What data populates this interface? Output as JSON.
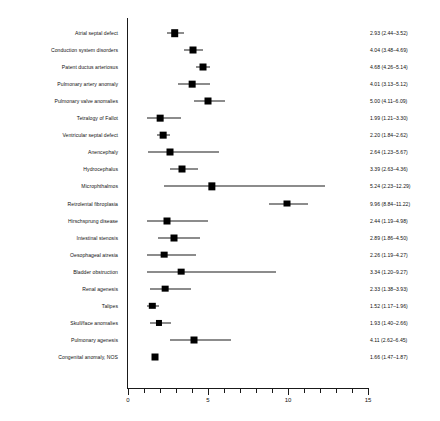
{
  "chart_data": {
    "type": "scatter",
    "subtype": "forest-plot",
    "title": "",
    "xlabel": "",
    "ylabel": "",
    "xlim": [
      0,
      15
    ],
    "grid": false,
    "legend": null,
    "axis": {
      "major_ticks": [
        0,
        5,
        10,
        15
      ],
      "major_tick_labels": [
        "0",
        "5",
        "10",
        "15"
      ],
      "minor_tick_step": 1,
      "tick_values": [
        0,
        1,
        2,
        3,
        4,
        5,
        6,
        7,
        8,
        9,
        10,
        11,
        12,
        13,
        14,
        15
      ]
    },
    "categories": [
      "Atrial septal defect",
      "Conduction system disorders",
      "Patent ductus arteriosus",
      "Pulmonary artery anomaly",
      "Pulmonary valve anomalies",
      "Tetralogy of Fallot",
      "Ventricular septal defect",
      "Anencephaly",
      "Hydrocephalus",
      "Microphthalmos",
      "Retrolental fibroplasia",
      "Hirschsprung disease",
      "Intestinal stenosis",
      "Oesophageal atresia",
      "Bladder obstruction",
      "Renal agenesis",
      "Talipes",
      "Skull/face anomalies",
      "Pulmonary agenesis",
      "Congenital anomaly, NOS"
    ],
    "estimates": [
      2.93,
      4.04,
      4.68,
      4.01,
      5.0,
      1.99,
      2.2,
      2.64,
      3.39,
      5.24,
      9.96,
      2.44,
      2.89,
      2.26,
      3.34,
      2.33,
      1.52,
      1.93,
      4.11,
      1.66
    ],
    "ci_lower": [
      2.44,
      3.48,
      4.26,
      3.13,
      4.11,
      1.21,
      1.84,
      1.23,
      2.63,
      2.23,
      8.84,
      1.19,
      1.86,
      1.19,
      1.2,
      1.38,
      1.17,
      1.4,
      2.62,
      1.47
    ],
    "ci_upper": [
      3.52,
      4.69,
      5.14,
      5.12,
      6.09,
      3.3,
      2.62,
      5.67,
      4.36,
      12.29,
      11.22,
      4.98,
      4.5,
      4.27,
      9.27,
      3.93,
      1.96,
      2.66,
      6.45,
      1.87
    ],
    "marker_weights": [
      1.0,
      0.92,
      0.92,
      0.88,
      0.92,
      0.88,
      0.88,
      0.92,
      0.92,
      0.96,
      0.92,
      0.92,
      0.92,
      0.88,
      0.88,
      0.88,
      0.84,
      0.8,
      0.92,
      0.92
    ],
    "value_labels": [
      "2.93 (2.44–3.52)",
      "4.04 (3.48–4.69)",
      "4.68 (4.26–5.14)",
      "4.01 (3.13–5.12)",
      "5.00 (4.11–6.09)",
      "1.99 (1.21–3.30)",
      "2.20 (1.84–2.62)",
      "2.64 (1.23–5.67)",
      "3.39 (2.63–4.36)",
      "5.24 (2.23–12.29)",
      "9.96 (8.84–11.22)",
      "2.44 (1.19–4.98)",
      "2.89 (1.86–4.50)",
      "2.26 (1.19–4.27)",
      "3.34 (1.20–9.27)",
      "2.33 (1.38–3.93)",
      "1.52 (1.17–1.96)",
      "1.93 (1.40–2.66)",
      "4.11 (2.62–6.45)",
      "1.66 (1.47–1.87)"
    ],
    "colors": {
      "marker": "#000000",
      "ci_line": "#1a1a1a",
      "axis": "#1a1a1a",
      "text": "#111111",
      "background": "#ffffff"
    }
  }
}
